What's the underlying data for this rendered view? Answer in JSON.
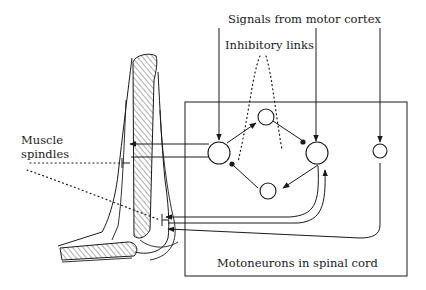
{
  "diagram": {
    "type": "neural-circuit-schematic",
    "labels": {
      "signals": "Signals from motor cortex",
      "inhibitory": "Inhibitory links",
      "muscle_line1": "Muscle",
      "muscle_line2": "spindles",
      "spinal_cord": "Motoneurons in spinal cord"
    },
    "nodes": [
      {
        "id": "motoneuron-left",
        "role": "motoneuron"
      },
      {
        "id": "interneuron-top",
        "role": "interneuron"
      },
      {
        "id": "interneuron-bottom",
        "role": "interneuron"
      },
      {
        "id": "motoneuron-right",
        "role": "motoneuron"
      },
      {
        "id": "motoneuron-far-right",
        "role": "motoneuron"
      }
    ],
    "colors": {
      "ink": "#1a1a1a",
      "background": "#ffffff",
      "hatch": "#333333"
    }
  }
}
